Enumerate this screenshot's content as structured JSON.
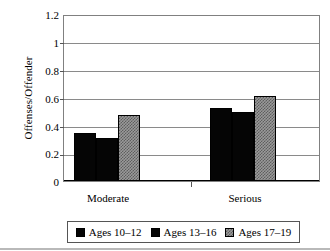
{
  "chart_data": {
    "type": "bar",
    "title": "",
    "xlabel": "",
    "ylabel": "Offenses/Offender",
    "categories": [
      "Moderate",
      "Serious"
    ],
    "series": [
      {
        "name": "Ages 10-12",
        "label": "Ages 10–12",
        "swatch": "solid-black",
        "color": "#050505",
        "values": [
          0.35,
          0.53
        ]
      },
      {
        "name": "Ages 13-16",
        "label": "Ages 13–16",
        "swatch": "solid-black",
        "color": "#050505",
        "values": [
          0.31,
          0.5
        ]
      },
      {
        "name": "Ages 17-19",
        "label": "Ages 17–19",
        "swatch": "checker-gray",
        "color": "#9a9a9a",
        "values": [
          0.48,
          0.62
        ]
      }
    ],
    "ylim": [
      0,
      1.2
    ],
    "ytick_values": [
      0,
      0.2,
      0.4,
      0.6,
      0.8,
      1.0,
      1.2
    ],
    "ytick_labels": [
      "0",
      "0.2",
      "0.4",
      "0.6",
      "0.8",
      "1",
      "1.2"
    ],
    "grid": "horizontal",
    "legend_position": "bottom"
  },
  "axis": {
    "y_title": "Offenses/Offender",
    "tick_0": "0",
    "tick_1": "0.2",
    "tick_2": "0.4",
    "tick_3": "0.6",
    "tick_4": "0.8",
    "tick_5": "1",
    "tick_6": "1.2"
  },
  "categories": {
    "c0": "Moderate",
    "c1": "Serious"
  },
  "legend": {
    "items": [
      {
        "label": "Ages 10–12"
      },
      {
        "label": "Ages 13–16"
      },
      {
        "label": "Ages 17–19"
      }
    ]
  }
}
